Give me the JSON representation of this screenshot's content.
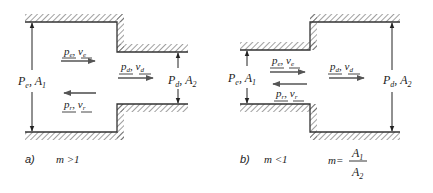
{
  "figure": {
    "panel_a": {
      "caption_letter": "a)",
      "condition": "m >1",
      "labels": {
        "inlet_section": {
          "P": "P",
          "P_sub": "e",
          "sep": ", ",
          "A": "A",
          "A_sub": "1"
        },
        "outlet_section": {
          "P": "P",
          "P_sub": "d",
          "sep": ", ",
          "A": "A",
          "A_sub": "2"
        },
        "incident_wave": {
          "p": "p",
          "p_sub": "e",
          "sep": ", ",
          "v": "v",
          "v_sub": "e",
          "direction": "right"
        },
        "transmitted_wave": {
          "p": "p",
          "p_sub": "d",
          "sep": ", ",
          "v": "v",
          "v_sub": "d",
          "direction": "right"
        },
        "reflected_wave": {
          "p": "p",
          "p_sub": "r",
          "sep": ", ",
          "v": "v",
          "v_sub": "r",
          "direction": "left"
        }
      }
    },
    "panel_b": {
      "caption_letter": "b)",
      "condition": "m <1",
      "labels": {
        "inlet_section": {
          "P": "P",
          "P_sub": "e",
          "sep": ", ",
          "A": "A",
          "A_sub": "1"
        },
        "outlet_section": {
          "P": "P",
          "P_sub": "d",
          "sep": ", ",
          "A": "A",
          "A_sub": "2"
        },
        "incident_wave": {
          "p": "p",
          "p_sub": "e",
          "sep": ", ",
          "v": "v",
          "v_sub": "e",
          "direction": "right"
        },
        "transmitted_wave": {
          "p": "p",
          "p_sub": "d",
          "sep": ", ",
          "v": "v",
          "v_sub": "d",
          "direction": "right"
        },
        "reflected_wave": {
          "p": "p",
          "p_sub": "r",
          "sep": ", ",
          "v": "v",
          "v_sub": "r",
          "direction": "left"
        }
      }
    },
    "formula": {
      "lhs": "m",
      "eq": "=",
      "numerator": "A",
      "numerator_sub": "1",
      "denominator": "A",
      "denominator_sub": "2"
    },
    "colors": {
      "line": "#333333",
      "flow_arrow": "#555555",
      "text": "#222222",
      "background": "#ffffff"
    }
  }
}
